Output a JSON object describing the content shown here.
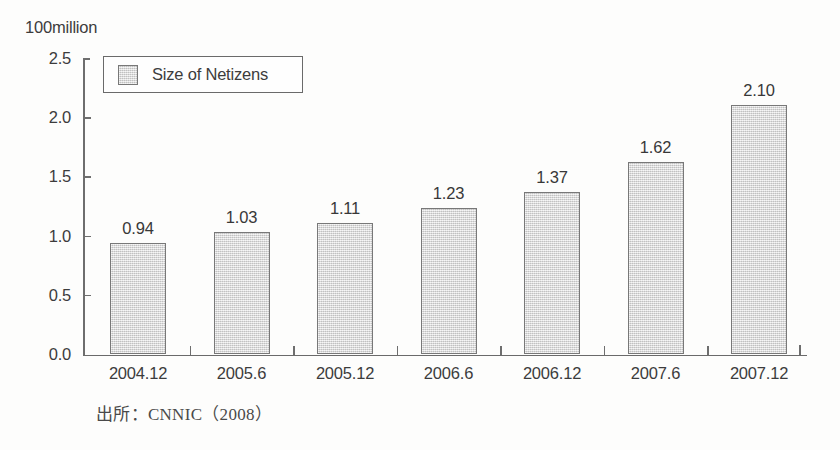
{
  "unit_label": "100million",
  "legend": {
    "swatch_color": "#dcdcdc",
    "label": "Size of Netizens"
  },
  "source_caption": "出所：CNNIC（2008）",
  "axis": {
    "y_ticks": [
      "0.0",
      "0.5",
      "1.0",
      "1.5",
      "2.0",
      "2.5"
    ]
  },
  "chart_data": {
    "type": "bar",
    "title": "",
    "subtitle": "",
    "xlabel": "",
    "ylabel": "100million",
    "ylim": [
      0.0,
      2.5
    ],
    "ytick_step": 0.5,
    "grid": false,
    "legend_position": "top-left",
    "categories": [
      "2004.12",
      "2005.6",
      "2005.12",
      "2006.6",
      "2006.12",
      "2007.6",
      "2007.12"
    ],
    "series": [
      {
        "name": "Size of Netizens",
        "values": [
          0.94,
          1.03,
          1.11,
          1.23,
          1.37,
          1.62,
          2.1
        ],
        "labels": [
          "0.94",
          "1.03",
          "1.11",
          "1.23",
          "1.37",
          "1.62",
          "2.10"
        ],
        "color": "#dcdcdc",
        "edge_color": "#787878"
      }
    ],
    "annotations": [
      "出所：CNNIC（2008）"
    ]
  }
}
